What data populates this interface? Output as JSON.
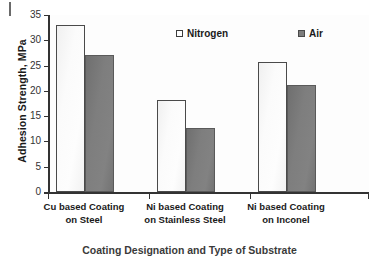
{
  "chart_data": {
    "type": "bar",
    "title": "",
    "xlabel": "Coating Designation and Type of Substrate",
    "ylabel": "Adhesion Strength, MPa",
    "ylim": [
      0,
      35
    ],
    "ytick_step": 5,
    "yticks": [
      "35",
      "30",
      "25",
      "20",
      "15",
      "10",
      "5",
      "0"
    ],
    "grid": false,
    "legend_position": "inside-top-center",
    "categories": [
      "Cu based Coating on Steel",
      "Ni based Coating on Stainless Steel",
      "Ni based Coating on Inconel"
    ],
    "category_lines": [
      [
        "Cu based Coating",
        "on Steel"
      ],
      [
        "Ni based Coating",
        "on Stainless Steel"
      ],
      [
        "Ni based Coating",
        "on Inconel"
      ]
    ],
    "series": [
      {
        "name": "Nitrogen",
        "color": "#fdfdfd",
        "values": [
          33.0,
          18.2,
          25.7
        ]
      },
      {
        "name": "Air",
        "color": "#7d7d7d",
        "values": [
          27.0,
          12.6,
          21.1
        ]
      }
    ]
  },
  "axis": {
    "y_title": "Adhesion Strength, MPa",
    "x_title": "Coating Designation and Type of Substrate"
  },
  "legend": {
    "items": [
      {
        "label": "Nitrogen",
        "swatch": "legend-swatch-nitrogen"
      },
      {
        "label": "Air",
        "swatch": "legend-swatch-air"
      }
    ]
  }
}
